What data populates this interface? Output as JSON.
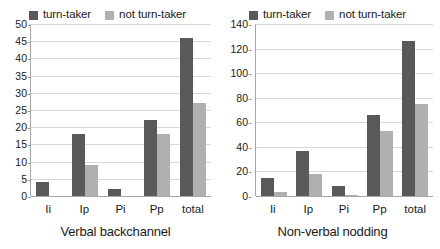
{
  "chart_data": [
    {
      "type": "bar",
      "title": "Verbal backchannel",
      "xlabel": "",
      "ylabel": "",
      "categories": [
        "Ii",
        "Ip",
        "Pi",
        "Pp",
        "total"
      ],
      "series": [
        {
          "name": "turn-taker",
          "color": "#595959",
          "values": [
            4,
            18,
            2,
            22,
            46
          ]
        },
        {
          "name": "not turn-taker",
          "color": "#b0b0b0",
          "values": [
            0,
            9,
            0,
            18,
            27
          ]
        }
      ],
      "ylim": [
        0,
        50
      ],
      "yticks": [
        0,
        5,
        10,
        15,
        20,
        25,
        30,
        35,
        40,
        45,
        50
      ],
      "grid": true,
      "legend_position": "top-center"
    },
    {
      "type": "bar",
      "title": "Non-verbal nodding",
      "xlabel": "",
      "ylabel": "",
      "categories": [
        "Ii",
        "Ip",
        "Pi",
        "Pp",
        "total"
      ],
      "series": [
        {
          "name": "turn-taker",
          "color": "#595959",
          "values": [
            15,
            37,
            8,
            66,
            126
          ]
        },
        {
          "name": "not turn-taker",
          "color": "#b0b0b0",
          "values": [
            3,
            18,
            1,
            53,
            75
          ]
        }
      ],
      "ylim": [
        0,
        140
      ],
      "yticks": [
        0,
        20,
        40,
        60,
        80,
        100,
        120,
        140
      ],
      "grid": true,
      "legend_position": "top-center"
    }
  ]
}
